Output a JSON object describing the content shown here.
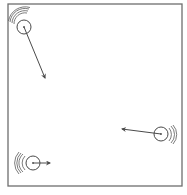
{
  "diagram": {
    "colors": {
      "stroke": "#4a4a4a",
      "frame": "#6e6e6e",
      "background": "#ffffff"
    },
    "box": {
      "x": 8,
      "y": 4,
      "width": 174,
      "height": 182
    },
    "balls": [
      {
        "id": "ball-top-left",
        "center": [
          24,
          27
        ],
        "radius": 7,
        "arrow_end": [
          45,
          78
        ],
        "motion_lines_side": "upper-left"
      },
      {
        "id": "ball-right",
        "center": [
          161,
          134
        ],
        "radius": 7,
        "arrow_end": [
          122,
          129
        ],
        "motion_lines_side": "right"
      },
      {
        "id": "ball-bottom-left",
        "center": [
          33,
          163
        ],
        "radius": 7,
        "arrow_end": [
          50,
          163
        ],
        "motion_lines_side": "left"
      }
    ]
  }
}
